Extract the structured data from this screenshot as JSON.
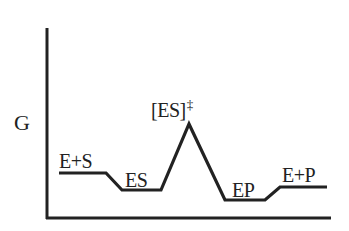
{
  "diagram": {
    "type": "reaction-energy-profile",
    "axis": {
      "y_label": "G",
      "x_label": ""
    },
    "states": [
      {
        "id": "reactants",
        "label": "E+S",
        "level": "high"
      },
      {
        "id": "enzyme_substrate_complex",
        "label": "ES",
        "level": "low"
      },
      {
        "id": "transition_state",
        "label_main": "[ES]",
        "label_superscript": "‡",
        "level": "peak"
      },
      {
        "id": "enzyme_product_complex",
        "label": "EP",
        "level": "lowest"
      },
      {
        "id": "products",
        "label": "E+P",
        "level": "medium"
      }
    ],
    "colors": {
      "line": "#222222",
      "background": "#ffffff"
    }
  }
}
